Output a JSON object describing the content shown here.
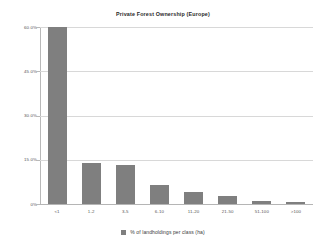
{
  "chart_data": {
    "type": "bar",
    "title": "Private Forest Ownership (Europe)",
    "xlabel": "",
    "ylabel": "",
    "categories": [
      "<1",
      "1-2",
      "3-5",
      "6-10",
      "11-20",
      "21-50",
      "51-100",
      ">100"
    ],
    "values": [
      60.0,
      14.0,
      13.3,
      6.3,
      4.2,
      2.8,
      1.0,
      0.7
    ],
    "series": [
      {
        "name": "% of landholdings per class (ha)",
        "values": [
          60.0,
          14.0,
          13.3,
          6.3,
          4.2,
          2.8,
          1.0,
          0.7
        ]
      }
    ],
    "ylim": [
      0,
      60
    ],
    "yticks": [
      0,
      15,
      30,
      45,
      60
    ],
    "ytick_labels": [
      "0%",
      "15.0%",
      "30.0%",
      "45.0%",
      "60.0%"
    ],
    "grid": true,
    "legend_position": "bottom",
    "bar_color": "#7f7f7f",
    "gridline_color": "#d8d8d8",
    "axis_color": "#b9b9b9",
    "background_color": "#ffffff"
  },
  "legend": {
    "entries": [
      {
        "label": "% of landholdings per class (ha)",
        "color": "#7f7f7f",
        "swatch_icon": "square-swatch-icon"
      }
    ]
  }
}
